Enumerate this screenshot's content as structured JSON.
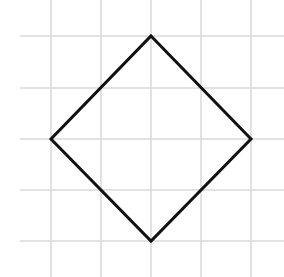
{
  "diagram": {
    "type": "shape-on-grid",
    "shape": "square rotated 45 degrees (diamond)",
    "colors": {
      "background": "#ffffff",
      "grid": "#d9d9d9",
      "shape_stroke": "#111111"
    },
    "grid": {
      "vertical_x": [
        51,
        101,
        151,
        201,
        251
      ],
      "horizontal_y": [
        36,
        88,
        139,
        190,
        241
      ],
      "horizontal_x_start": 20,
      "horizontal_x_end": 284,
      "vertical_y_start": 0,
      "vertical_y_end": 277
    },
    "vertices": [
      {
        "name": "top",
        "x": 151,
        "y": 36
      },
      {
        "name": "right",
        "x": 251,
        "y": 139
      },
      {
        "name": "bottom",
        "x": 151,
        "y": 241
      },
      {
        "name": "left",
        "x": 51,
        "y": 139
      }
    ],
    "stroke_width": 3
  }
}
